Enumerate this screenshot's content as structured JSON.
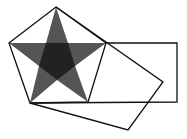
{
  "diagram": {
    "colors": {
      "stroke": "#111111",
      "star_fill": "#555555",
      "inner_fill": "#222222",
      "background": "#ffffff"
    },
    "pentagon": [
      [
        56,
        7
      ],
      [
        106,
        43
      ],
      [
        88,
        102
      ],
      [
        30,
        103
      ],
      [
        9,
        43
      ]
    ],
    "star": [
      [
        56,
        7
      ],
      [
        68,
        43
      ],
      [
        106,
        43
      ],
      [
        75,
        66
      ],
      [
        88,
        102
      ],
      [
        57,
        80
      ],
      [
        30,
        103
      ],
      [
        39,
        66
      ],
      [
        9,
        43
      ],
      [
        46,
        43
      ]
    ],
    "inner_pentagon": [
      [
        46,
        43
      ],
      [
        68,
        43
      ],
      [
        75,
        66
      ],
      [
        57,
        80
      ],
      [
        39,
        66
      ]
    ],
    "horizontal_rectangle": [
      [
        106,
        43
      ],
      [
        177,
        43
      ],
      [
        177,
        102
      ],
      [
        30,
        103
      ]
    ],
    "rotated_rectangle": [
      [
        56,
        7
      ],
      [
        163,
        82
      ],
      [
        128,
        130
      ],
      [
        30,
        103
      ]
    ]
  }
}
